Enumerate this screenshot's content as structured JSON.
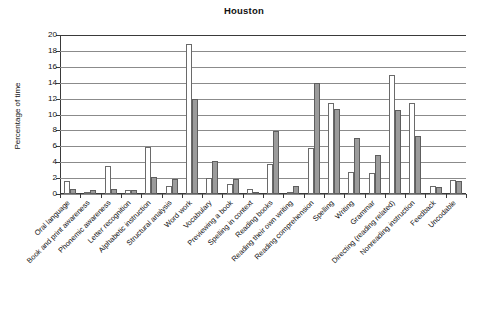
{
  "chart_data": {
    "type": "bar",
    "title": "Houston",
    "xlabel": "",
    "ylabel": "Percentage of time",
    "ylim": [
      0,
      20
    ],
    "ytick_step": 2,
    "yticks": [
      "20",
      "18",
      "16",
      "14",
      "12",
      "10",
      "8",
      "6",
      "4",
      "2",
      "0"
    ],
    "grid": true,
    "legend": "none",
    "series_count": 2,
    "series_colors": [
      "#ffffff",
      "#9b9b9b"
    ],
    "categories": [
      "Oral language",
      "Book and print awareness",
      "Phonemic awareness",
      "Letter recognition",
      "Alphabetic instruction",
      "Structural analysis",
      "Word work",
      "Vocabulary",
      "Previewing a book",
      "Spelling in context",
      "Reading books",
      "Reading their own writing",
      "Reading comprehension",
      "Spelling",
      "Writing",
      "Grammar",
      "Directing (reading related)",
      "Nonreading  instruction",
      "Feedback",
      "Uncodable"
    ],
    "series": [
      {
        "name": "series-1",
        "values": [
          1.6,
          0.25,
          3.5,
          0.45,
          5.9,
          1.0,
          18.9,
          2.0,
          1.3,
          0.65,
          3.8,
          0.2,
          5.85,
          11.5,
          2.75,
          2.6,
          15.0,
          11.5,
          1.05,
          1.8
        ]
      },
      {
        "name": "series-2",
        "values": [
          0.65,
          0.5,
          0.65,
          0.55,
          2.1,
          1.9,
          12.0,
          4.1,
          1.9,
          0.3,
          7.9,
          1.0,
          14.0,
          10.75,
          7.1,
          4.85,
          10.6,
          7.3,
          0.9,
          1.65
        ]
      }
    ]
  }
}
